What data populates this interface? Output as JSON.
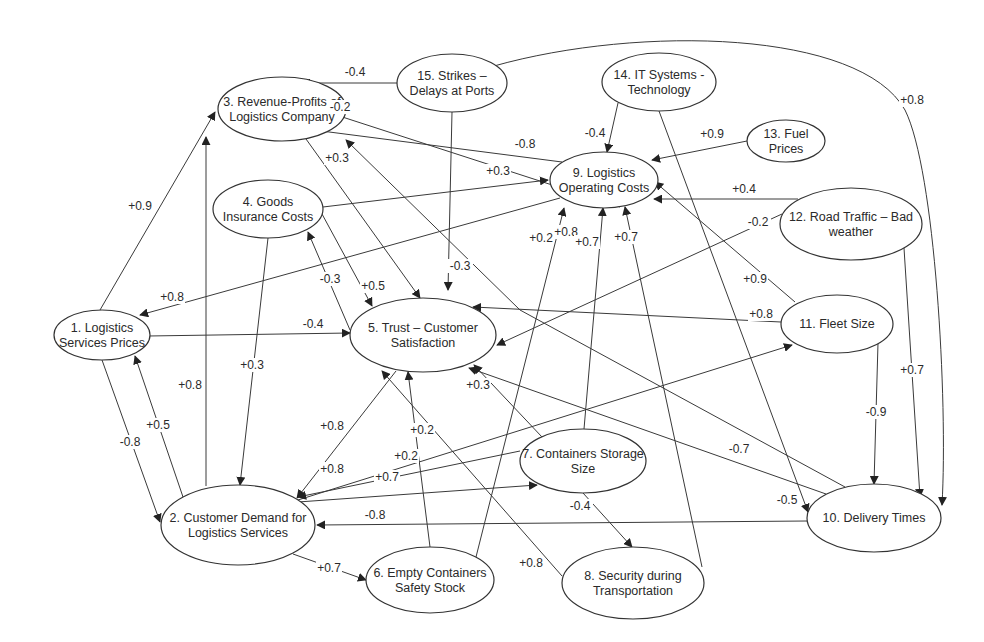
{
  "diagram": {
    "nodes": [
      {
        "id": 1,
        "label_lines": [
          "1. Logistics",
          "Services Prices"
        ],
        "cx": 102,
        "cy": 335,
        "rx": 48,
        "ry": 25
      },
      {
        "id": 2,
        "label_lines": [
          "2. Customer Demand for",
          "Logistics Services"
        ],
        "cx": 238,
        "cy": 525,
        "rx": 77,
        "ry": 40
      },
      {
        "id": 3,
        "label_lines": [
          "3. Revenue-Profits of",
          "Logistics Company"
        ],
        "cx": 282,
        "cy": 109,
        "rx": 64,
        "ry": 32
      },
      {
        "id": 4,
        "label_lines": [
          "4. Goods",
          "Insurance Costs"
        ],
        "cx": 268,
        "cy": 209,
        "rx": 55,
        "ry": 29
      },
      {
        "id": 5,
        "label_lines": [
          "5. Trust – Customer",
          "Satisfaction"
        ],
        "cx": 423,
        "cy": 335,
        "rx": 73,
        "ry": 37
      },
      {
        "id": 6,
        "label_lines": [
          "6. Empty Containers",
          "Safety Stock"
        ],
        "cx": 430,
        "cy": 580,
        "rx": 64,
        "ry": 33
      },
      {
        "id": 7,
        "label_lines": [
          "7. Containers Storage",
          "Size"
        ],
        "cx": 583,
        "cy": 461,
        "rx": 63,
        "ry": 32
      },
      {
        "id": 8,
        "label_lines": [
          "8. Security during",
          "Transportation"
        ],
        "cx": 633,
        "cy": 583,
        "rx": 71,
        "ry": 36
      },
      {
        "id": 9,
        "label_lines": [
          "9. Logistics",
          "Operating Costs"
        ],
        "cx": 604,
        "cy": 180,
        "rx": 54,
        "ry": 28
      },
      {
        "id": 10,
        "label_lines": [
          "10. Delivery Times"
        ],
        "cx": 874,
        "cy": 518,
        "rx": 67,
        "ry": 34
      },
      {
        "id": 11,
        "label_lines": [
          "11. Fleet Size"
        ],
        "cx": 837,
        "cy": 324,
        "rx": 56,
        "ry": 29
      },
      {
        "id": 12,
        "label_lines": [
          "12. Road Traffic – Bad",
          "weather"
        ],
        "cx": 851,
        "cy": 224,
        "rx": 71,
        "ry": 36
      },
      {
        "id": 13,
        "label_lines": [
          "13. Fuel",
          "Prices"
        ],
        "cx": 786,
        "cy": 141,
        "rx": 39,
        "ry": 21
      },
      {
        "id": 14,
        "label_lines": [
          "14. IT Systems -",
          "Technology"
        ],
        "cx": 659,
        "cy": 82,
        "rx": 57,
        "ry": 29
      },
      {
        "id": 15,
        "label_lines": [
          "15. Strikes –",
          "Delays at Ports"
        ],
        "cx": 452,
        "cy": 83,
        "rx": 55,
        "ry": 29
      }
    ],
    "edges": [
      {
        "from": 15,
        "to": 3,
        "weight": "-0.4",
        "path": "M397,83 L302,83",
        "lx": 355,
        "ly": 76
      },
      {
        "from": 15,
        "to": 10,
        "weight": "+0.8",
        "path": "M494,66 C640,25 860,30 905,110 C935,170 948,400 942,505",
        "lx": 912,
        "ly": 104
      },
      {
        "from": 15,
        "to": 5,
        "weight": "-0.3",
        "path": "M452,112 L448,290",
        "lx": 460,
        "ly": 270
      },
      {
        "from": 9,
        "to": 3,
        "weight": "-0.2",
        "path": "M620,207 L330,113",
        "lx": 340,
        "ly": 111
      },
      {
        "from": 9,
        "to": 3,
        "weight": "-0.8",
        "path": "M562,162 L306,129",
        "lx": 525,
        "ly": 148
      },
      {
        "from": 3,
        "to": 5,
        "weight": "+0.3",
        "path": "M306,139 L420,298",
        "lx": 337,
        "ly": 162
      },
      {
        "from": 1,
        "to": 3,
        "weight": "+0.9",
        "path": "M100,310 L215,112",
        "lx": 140,
        "ly": 210
      },
      {
        "from": 2,
        "to": 3,
        "weight": "+0.8",
        "path": "M206,486 L206,137",
        "lx": 190,
        "ly": 389
      },
      {
        "from": 4,
        "to": 9,
        "weight": "+0.3",
        "path": "M323,207 L548,180",
        "lx": 498,
        "ly": 175
      },
      {
        "from": 4,
        "to": 5,
        "weight": "+0.5",
        "path": "M322,214 L372,306",
        "lx": 373,
        "ly": 290
      },
      {
        "from": 5,
        "to": 4,
        "weight": "-0.3",
        "path": "M350,330 L308,232",
        "lx": 330,
        "ly": 283
      },
      {
        "from": 4,
        "to": 2,
        "weight": "+0.3",
        "path": "M268,238 L240,485",
        "lx": 252,
        "ly": 369
      },
      {
        "from": 9,
        "to": 1,
        "weight": "+0.8",
        "path": "M560,198 L140,315",
        "lx": 172,
        "ly": 301
      },
      {
        "from": 1,
        "to": 5,
        "weight": "-0.4",
        "path": "M148,336 L350,333",
        "lx": 313,
        "ly": 328
      },
      {
        "from": 1,
        "to": 2,
        "weight": "-0.8",
        "path": "M102,360 L160,522",
        "lx": 130,
        "ly": 446
      },
      {
        "from": 2,
        "to": 1,
        "weight": "+0.5",
        "path": "M183,497 L135,356",
        "lx": 158,
        "ly": 429
      },
      {
        "from": 14,
        "to": 9,
        "weight": "-0.4",
        "path": "M618,103 L607,152",
        "lx": 595,
        "ly": 137
      },
      {
        "from": 14,
        "to": 10,
        "weight": "-0.5",
        "path": "M659,111 L808,512",
        "lx": 787,
        "ly": 504
      },
      {
        "from": 13,
        "to": 9,
        "weight": "+0.9",
        "path": "M747,141 L652,160",
        "lx": 712,
        "ly": 138
      },
      {
        "from": 12,
        "to": 9,
        "weight": "+0.4",
        "path": "M798,199 L654,199",
        "lx": 744,
        "ly": 193
      },
      {
        "from": 12,
        "to": 5,
        "weight": "-0.2",
        "path": "M782,214 L497,345",
        "lx": 758,
        "ly": 226
      },
      {
        "from": 12,
        "to": 10,
        "weight": "+0.7",
        "path": "M904,248 L920,497",
        "lx": 912,
        "ly": 374
      },
      {
        "from": 11,
        "to": 9,
        "weight": "+0.9",
        "path": "M795,302 L655,182",
        "lx": 755,
        "ly": 283
      },
      {
        "from": 11,
        "to": 5,
        "weight": "+0.8",
        "path": "M781,322 L473,307",
        "lx": 761,
        "ly": 318
      },
      {
        "from": 11,
        "to": 10,
        "weight": "-0.9",
        "path": "M878,343 L874,484",
        "lx": 876,
        "ly": 416
      },
      {
        "from": 2,
        "to": 11,
        "weight": "+0.2",
        "path": "M298,500 L792,345",
        "lx": 406,
        "ly": 460
      },
      {
        "from": 10,
        "to": 3,
        "weight": "+0.8",
        "path": "M845,487 L520,310 L346,140",
        "lx": 566,
        "ly": 236
      },
      {
        "from": 10,
        "to": 5,
        "weight": "-0.7",
        "path": "M826,494 L469,368",
        "lx": 739,
        "ly": 453
      },
      {
        "from": 10,
        "to": 2,
        "weight": "-0.8",
        "path": "M807,521 L317,525",
        "lx": 375,
        "ly": 519
      },
      {
        "from": 5,
        "to": 2,
        "weight": "+0.8",
        "path": "M396,371 L297,498",
        "lx": 332,
        "ly": 430
      },
      {
        "from": 7,
        "to": 2,
        "weight": "+0.8",
        "path": "M520,451 L298,497",
        "lx": 332,
        "ly": 473
      },
      {
        "from": 2,
        "to": 7,
        "weight": "+0.7",
        "path": "M298,502 L537,485",
        "lx": 387,
        "ly": 481
      },
      {
        "from": 2,
        "to": 6,
        "weight": "+0.7",
        "path": "M293,554 L366,580",
        "lx": 329,
        "ly": 572
      },
      {
        "from": 7,
        "to": 5,
        "weight": "+0.3",
        "path": "M542,437 L474,365",
        "lx": 478,
        "ly": 389
      },
      {
        "from": 6,
        "to": 5,
        "weight": "+0.2",
        "path": "M430,547 L408,372",
        "lx": 422,
        "ly": 434
      },
      {
        "from": 8,
        "to": 5,
        "weight": "+0.8",
        "path": "M562,576 L382,371",
        "lx": 531,
        "ly": 567
      },
      {
        "from": 7,
        "to": 8,
        "weight": "-0.4",
        "path": "M583,493 L632,547",
        "lx": 580,
        "ly": 510
      },
      {
        "from": 6,
        "to": 9,
        "weight": "+0.2",
        "path": "M476,557 L564,208",
        "lx": 541,
        "ly": 242
      },
      {
        "from": 7,
        "to": 9,
        "weight": "+0.7",
        "path": "M584,429 L603,208",
        "lx": 587,
        "ly": 246
      },
      {
        "from": 8,
        "to": 9,
        "weight": "+0.7",
        "path": "M702,567 L625,207",
        "lx": 626,
        "ly": 241
      }
    ]
  }
}
